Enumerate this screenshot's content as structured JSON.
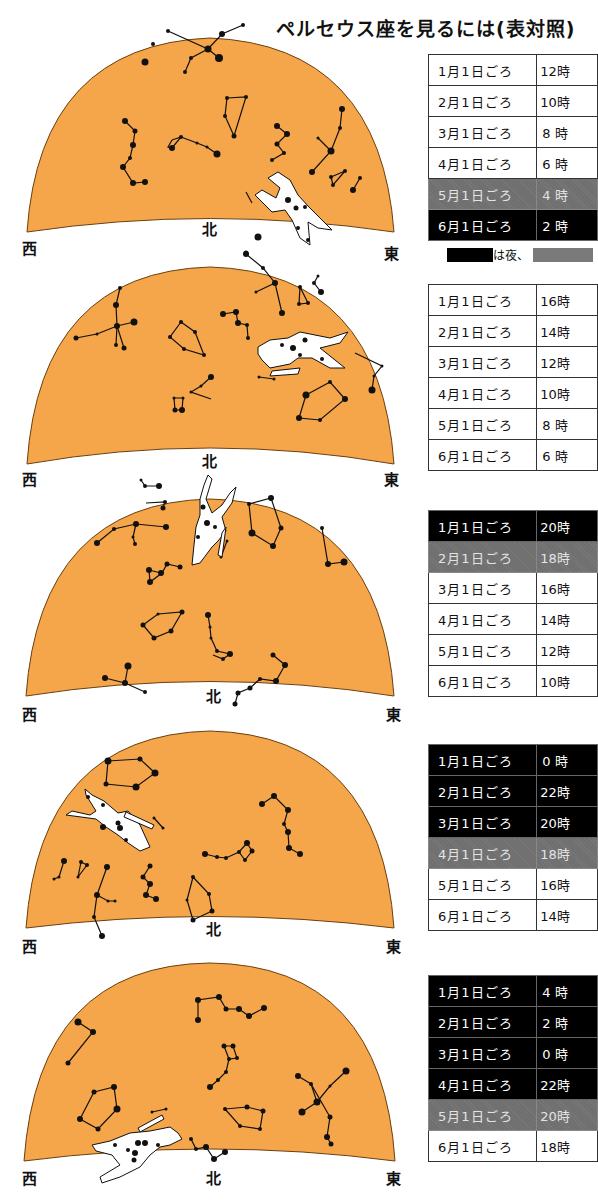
{
  "title": "ペルセウス座を見るには(表対照)",
  "colors": {
    "sky": "#F5A54A",
    "night": "#000000",
    "twilight": "#6E6E6E",
    "stars": "#111111"
  },
  "directions": {
    "west": "西",
    "north": "北",
    "east": "東"
  },
  "legend": {
    "night_label": "は夜、"
  },
  "panels": [
    {
      "rows": [
        {
          "date": "1月1日ごろ",
          "time": "12時",
          "shade": "day"
        },
        {
          "date": "2月1日ごろ",
          "time": "10時",
          "shade": "day"
        },
        {
          "date": "3月1日ごろ",
          "time": "8 時",
          "shade": "day"
        },
        {
          "date": "4月1日ごろ",
          "time": "6 時",
          "shade": "day"
        },
        {
          "date": "5月1日ごろ",
          "time": "4 時",
          "shade": "twilight"
        },
        {
          "date": "6月1日ごろ",
          "time": "2 時",
          "shade": "night"
        }
      ]
    },
    {
      "rows": [
        {
          "date": "1月1日ごろ",
          "time": "16時",
          "shade": "day"
        },
        {
          "date": "2月1日ごろ",
          "time": "14時",
          "shade": "day"
        },
        {
          "date": "3月1日ごろ",
          "time": "12時",
          "shade": "day"
        },
        {
          "date": "4月1日ごろ",
          "time": "10時",
          "shade": "day"
        },
        {
          "date": "5月1日ごろ",
          "time": "8 時",
          "shade": "day"
        },
        {
          "date": "6月1日ごろ",
          "time": "6 時",
          "shade": "day"
        }
      ]
    },
    {
      "rows": [
        {
          "date": "1月1日ごろ",
          "time": "20時",
          "shade": "night"
        },
        {
          "date": "2月1日ごろ",
          "time": "18時",
          "shade": "twilight"
        },
        {
          "date": "3月1日ごろ",
          "time": "16時",
          "shade": "day"
        },
        {
          "date": "4月1日ごろ",
          "time": "14時",
          "shade": "day"
        },
        {
          "date": "5月1日ごろ",
          "time": "12時",
          "shade": "day"
        },
        {
          "date": "6月1日ごろ",
          "time": "10時",
          "shade": "day"
        }
      ]
    },
    {
      "rows": [
        {
          "date": "1月1日ごろ",
          "time": "0 時",
          "shade": "night"
        },
        {
          "date": "2月1日ごろ",
          "time": "22時",
          "shade": "night"
        },
        {
          "date": "3月1日ごろ",
          "time": "20時",
          "shade": "night"
        },
        {
          "date": "4月1日ごろ",
          "time": "18時",
          "shade": "twilight"
        },
        {
          "date": "5月1日ごろ",
          "time": "16時",
          "shade": "day"
        },
        {
          "date": "6月1日ごろ",
          "time": "14時",
          "shade": "day"
        }
      ]
    },
    {
      "rows": [
        {
          "date": "1月1日ごろ",
          "time": "4 時",
          "shade": "night"
        },
        {
          "date": "2月1日ごろ",
          "time": "2 時",
          "shade": "night"
        },
        {
          "date": "3月1日ごろ",
          "time": "0 時",
          "shade": "night"
        },
        {
          "date": "4月1日ごろ",
          "time": "22時",
          "shade": "night"
        },
        {
          "date": "5月1日ごろ",
          "time": "20時",
          "shade": "twilight"
        },
        {
          "date": "6月1日ごろ",
          "time": "18時",
          "shade": "day"
        }
      ]
    }
  ]
}
